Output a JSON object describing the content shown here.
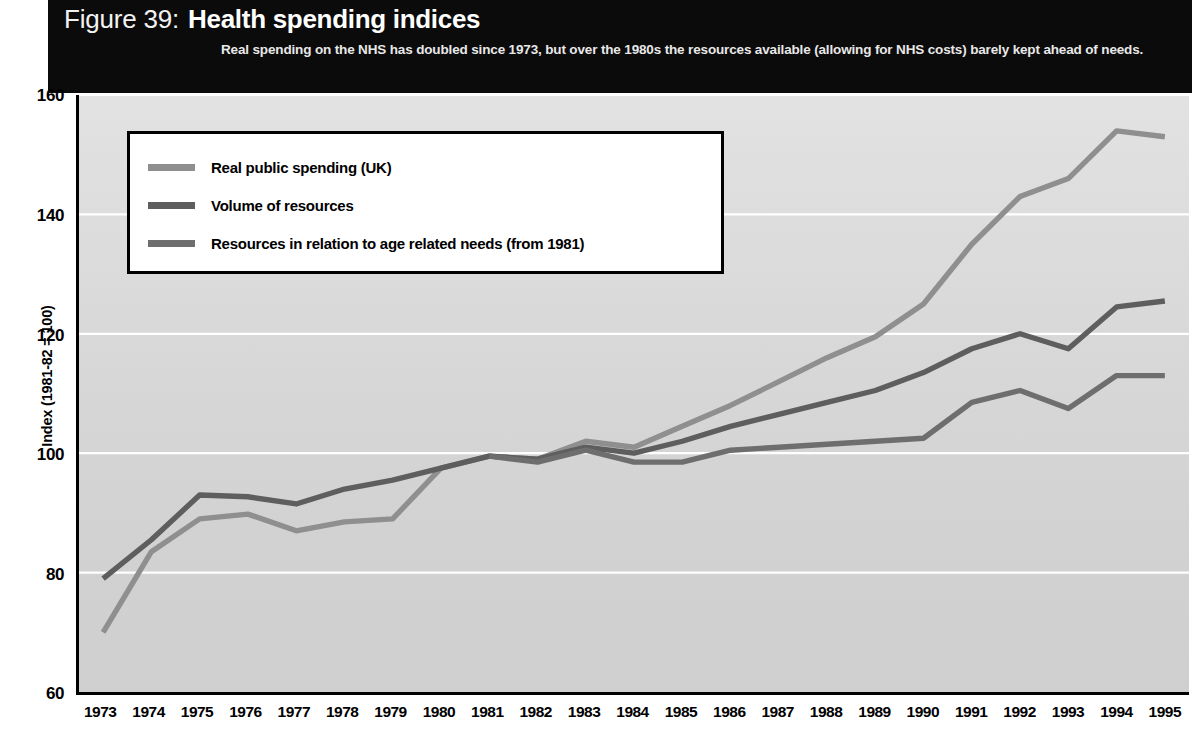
{
  "header": {
    "figure_number": "Figure 39:",
    "title": "Health spending indices",
    "subtitle": "Real spending on the NHS has doubled since 1973, but over the 1980s the resources available (allowing for NHS costs) barely kept ahead of needs."
  },
  "colors": {
    "header_background": "#0b0b0b",
    "header_text": "#ffffff",
    "plot_background": "#d6d6d6",
    "gridline": "#ffffff",
    "axis": "#000000",
    "series_real_public_spending": "#8f8f8f",
    "series_volume_of_resources": "#5e5e5e",
    "series_age_related_needs": "#6e6e6e"
  },
  "chart_data": {
    "type": "line",
    "title": "Health spending indices",
    "xlabel": "",
    "ylabel": "Index (1981-82 = 100)",
    "ylim": [
      60,
      160
    ],
    "yticks": [
      60,
      80,
      100,
      120,
      140,
      160
    ],
    "grid": true,
    "legend_position": "upper-left-inset",
    "x": [
      1973,
      1974,
      1975,
      1976,
      1977,
      1978,
      1979,
      1980,
      1981,
      1982,
      1983,
      1984,
      1985,
      1986,
      1987,
      1988,
      1989,
      1990,
      1991,
      1992,
      1993,
      1994,
      1995
    ],
    "categories": [
      "1973",
      "1974",
      "1975",
      "1976",
      "1977",
      "1978",
      "1979",
      "1980",
      "1981",
      "1982",
      "1983",
      "1984",
      "1985",
      "1986",
      "1987",
      "1988",
      "1989",
      "1990",
      "1991",
      "1992",
      "1993",
      "1994",
      "1995"
    ],
    "series": [
      {
        "name": "Real public spending (UK)",
        "color": "#8f8f8f",
        "values": [
          70.0,
          83.5,
          89.0,
          89.8,
          87.0,
          88.5,
          89.0,
          97.5,
          99.5,
          99.0,
          102.0,
          101.0,
          104.5,
          108.0,
          112.0,
          116.0,
          119.5,
          125.0,
          135.0,
          143.0,
          146.0,
          154.0,
          153.0
        ]
      },
      {
        "name": "Volume of resources",
        "color": "#5e5e5e",
        "values": [
          79.0,
          85.5,
          93.0,
          92.7,
          91.5,
          94.0,
          95.5,
          97.5,
          99.5,
          99.0,
          101.0,
          100.0,
          102.0,
          104.5,
          106.5,
          108.5,
          110.5,
          113.5,
          117.5,
          120.0,
          117.5,
          124.5,
          125.5
        ]
      },
      {
        "name": "Resources in relation to age related needs (from 1981)",
        "color": "#6e6e6e",
        "values": [
          null,
          null,
          null,
          null,
          null,
          null,
          null,
          null,
          99.5,
          98.5,
          100.5,
          98.5,
          98.5,
          100.5,
          101.0,
          101.5,
          102.0,
          102.5,
          108.5,
          110.5,
          107.5,
          113.0,
          113.0
        ]
      }
    ]
  },
  "legend": {
    "items": [
      {
        "label": "Real public spending (UK)",
        "color": "#8f8f8f"
      },
      {
        "label": "Volume of resources",
        "color": "#5e5e5e"
      },
      {
        "label": "Resources in relation to age related needs (from 1981)",
        "color": "#6e6e6e"
      }
    ]
  },
  "axes": {
    "y_title": "Index (1981-82 = 100)",
    "y_tick_labels": [
      "160",
      "140",
      "120",
      "100",
      "80",
      "60"
    ],
    "x_tick_labels": [
      "1973",
      "1974",
      "1975",
      "1976",
      "1977",
      "1978",
      "1979",
      "1980",
      "1981",
      "1982",
      "1983",
      "1984",
      "1985",
      "1986",
      "1987",
      "1988",
      "1989",
      "1990",
      "1991",
      "1992",
      "1993",
      "1994",
      "1995"
    ]
  }
}
